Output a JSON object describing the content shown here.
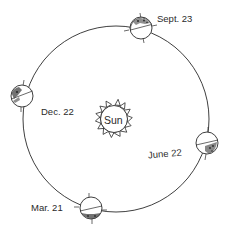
{
  "diagram": {
    "type": "earth-orbit-seasons",
    "center_label": "Sun",
    "positions": [
      {
        "id": "sept",
        "label": "Sept. 23"
      },
      {
        "id": "dec",
        "label": "Dec. 22"
      },
      {
        "id": "june",
        "label": "June 22"
      },
      {
        "id": "mar",
        "label": "Mar. 21"
      }
    ]
  },
  "colors": {
    "ink": "#2a2a2a",
    "background": "#ffffff"
  }
}
